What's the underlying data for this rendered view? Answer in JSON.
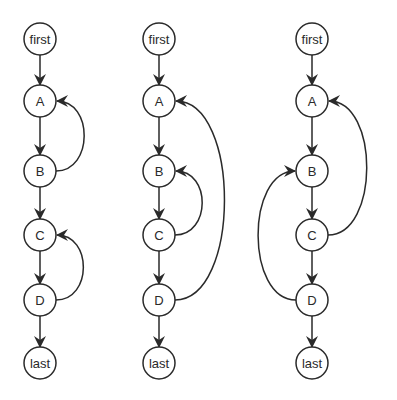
{
  "colors": {
    "stroke": "#2a2a2a",
    "background": "#ffffff"
  },
  "node_rows": {
    "first": 39,
    "A": 101,
    "B": 171,
    "C": 235,
    "D": 300,
    "last": 363
  },
  "graphs": [
    {
      "id": "graph-1",
      "x": 40,
      "nodes": [
        {
          "id": "first",
          "label": "first"
        },
        {
          "id": "A",
          "label": "A"
        },
        {
          "id": "B",
          "label": "B"
        },
        {
          "id": "C",
          "label": "C"
        },
        {
          "id": "D",
          "label": "D"
        },
        {
          "id": "last",
          "label": "last"
        }
      ],
      "back_edges": [
        {
          "from": "B",
          "to": "A",
          "side": "right"
        },
        {
          "from": "D",
          "to": "C",
          "side": "right"
        }
      ]
    },
    {
      "id": "graph-2",
      "x": 159,
      "nodes": [
        {
          "id": "first",
          "label": "first"
        },
        {
          "id": "A",
          "label": "A"
        },
        {
          "id": "B",
          "label": "B"
        },
        {
          "id": "C",
          "label": "C"
        },
        {
          "id": "D",
          "label": "D"
        },
        {
          "id": "last",
          "label": "last"
        }
      ],
      "back_edges": [
        {
          "from": "C",
          "to": "B",
          "side": "right"
        },
        {
          "from": "D",
          "to": "A",
          "side": "right"
        }
      ]
    },
    {
      "id": "graph-3",
      "x": 312,
      "nodes": [
        {
          "id": "first",
          "label": "first"
        },
        {
          "id": "A",
          "label": "A"
        },
        {
          "id": "B",
          "label": "B"
        },
        {
          "id": "C",
          "label": "C"
        },
        {
          "id": "D",
          "label": "D"
        },
        {
          "id": "last",
          "label": "last"
        }
      ],
      "back_edges": [
        {
          "from": "C",
          "to": "A",
          "side": "right"
        },
        {
          "from": "D",
          "to": "B",
          "side": "left"
        }
      ]
    }
  ]
}
